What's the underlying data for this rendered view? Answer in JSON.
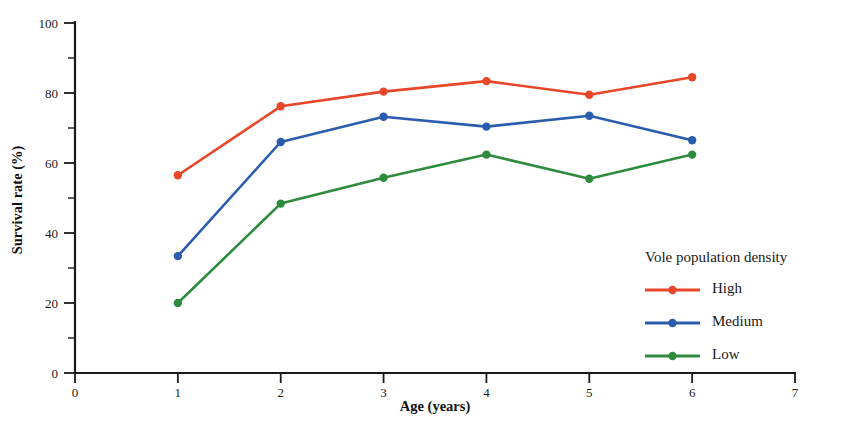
{
  "chart_data": {
    "type": "line",
    "title": "",
    "xlabel": "Age (years)",
    "ylabel": "Survival rate (%)",
    "xlim": [
      0,
      7
    ],
    "ylim": [
      0,
      100
    ],
    "x": [
      1,
      2,
      3,
      4,
      5,
      6
    ],
    "xticks": [
      "0",
      "1",
      "2",
      "3",
      "4",
      "5",
      "6",
      "7"
    ],
    "xtick_values": [
      0,
      1,
      2,
      3,
      4,
      5,
      6,
      7
    ],
    "yticks": [
      "0",
      "20",
      "40",
      "60",
      "80",
      "100"
    ],
    "ytick_values": [
      0,
      20,
      40,
      60,
      80,
      100
    ],
    "yminor_values": [
      10,
      30,
      50,
      70,
      90
    ],
    "grid": false,
    "legend_position": "inside-lower-right",
    "legend_title": "Vole population density",
    "series": [
      {
        "name": "High",
        "color": "#E8472A",
        "values": [
          56.5,
          76.2,
          80.4,
          83.4,
          79.5,
          84.5
        ]
      },
      {
        "name": "Medium",
        "color": "#2B5DAE",
        "values": [
          33.4,
          66.0,
          73.2,
          70.4,
          73.5,
          66.5
        ]
      },
      {
        "name": "Low",
        "color": "#2E8B3E",
        "values": [
          20.0,
          48.4,
          55.8,
          62.4,
          55.5,
          62.4
        ]
      }
    ]
  },
  "axes": {
    "y_axis_label": "Survival rate (%)",
    "x_axis_label": "Age (years)"
  }
}
